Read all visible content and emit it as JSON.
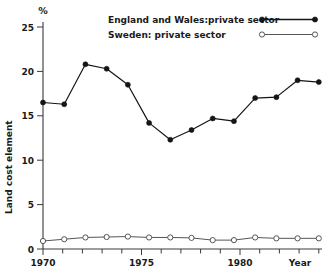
{
  "chart": {
    "unit_label": "%",
    "ylabel": "Land cost element",
    "xlabel": "Year",
    "y_ticks": [
      "0",
      "5",
      "10",
      "15",
      "20",
      "25"
    ],
    "x_ticks": [
      "1970",
      "1975",
      "1980"
    ]
  },
  "legend": {
    "items": [
      {
        "label": "England and Wales:private sector",
        "marker": "filled-circle",
        "color": "#151515"
      },
      {
        "label": "Sweden: private sector",
        "marker": "open-circle",
        "color": "#555555"
      }
    ]
  },
  "chart_data": {
    "type": "line",
    "title": "",
    "xlabel": "Year",
    "ylabel": "Land cost element",
    "unit": "%",
    "xlim": [
      1970,
      1983
    ],
    "ylim": [
      0,
      25
    ],
    "yticks": [
      0,
      5,
      10,
      15,
      20,
      25
    ],
    "xticks": [
      1970,
      1975,
      1980
    ],
    "grid": false,
    "legend_position": "top-right",
    "x": [
      1970,
      1971,
      1972,
      1973,
      1974,
      1975,
      1976,
      1977,
      1978,
      1979,
      1980,
      1981,
      1982,
      1983
    ],
    "series": [
      {
        "name": "England and Wales:private sector",
        "marker": "filled-circle",
        "color": "#151515",
        "values": [
          16.5,
          16.3,
          20.8,
          20.3,
          18.5,
          14.2,
          12.3,
          13.4,
          14.7,
          14.4,
          17.0,
          17.1,
          19.0,
          18.8
        ]
      },
      {
        "name": "Sweden: private sector",
        "marker": "open-circle",
        "color": "#555555",
        "values": [
          0.9,
          1.1,
          1.3,
          1.35,
          1.4,
          1.3,
          1.3,
          1.25,
          1.0,
          1.0,
          1.3,
          1.2,
          1.2,
          1.2
        ]
      }
    ]
  }
}
